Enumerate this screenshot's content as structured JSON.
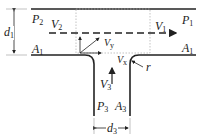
{
  "diagram": {
    "type": "tee-junction-flow",
    "labels": {
      "d1": {
        "main": "d",
        "sub": "1"
      },
      "P2": {
        "main": "P",
        "sub": "2"
      },
      "A1_left": {
        "main": "A",
        "sub": "1"
      },
      "V2": {
        "main": "V",
        "sub": "2"
      },
      "V1": {
        "main": "V",
        "sub": "1"
      },
      "P1": {
        "main": "P",
        "sub": "1"
      },
      "A1_right": {
        "main": "A",
        "sub": "1"
      },
      "Vy": {
        "main": "V",
        "sub": "y"
      },
      "Vx": {
        "main": "V",
        "sub": "x"
      },
      "r": {
        "main": "r",
        "sub": ""
      },
      "V3": {
        "main": "V",
        "sub": "3"
      },
      "P3": {
        "main": "P",
        "sub": "3"
      },
      "A3": {
        "main": "A",
        "sub": "3"
      },
      "d3": {
        "main": "d",
        "sub": "3"
      }
    },
    "colors": {
      "line": "#222222",
      "dotted": "#aaaaaa"
    }
  }
}
